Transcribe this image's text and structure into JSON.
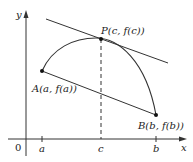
{
  "figure": {
    "colors": {
      "stroke": "#333333",
      "text": "#222222",
      "background": "#ffffff"
    },
    "axes": {
      "x_label": "x",
      "y_label": "y",
      "origin_label": "0"
    },
    "ticks": {
      "a": "a",
      "c": "c",
      "b": "b"
    },
    "points": {
      "A": "A(a, f(a))",
      "P": "P(c, f(c))",
      "B": "B(b, f(b))"
    },
    "elements": [
      {
        "name": "curve",
        "description": "graph of f from A to B, concave down with maximum near P"
      },
      {
        "name": "secant-line",
        "description": "line segment joining A and B"
      },
      {
        "name": "tangent-line",
        "description": "tangent line at P, parallel to secant AB"
      },
      {
        "name": "dashed-vertical",
        "description": "dashed line from P down to c on x-axis"
      }
    ]
  }
}
